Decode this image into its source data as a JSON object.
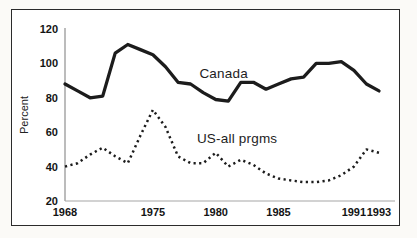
{
  "figure": {
    "kind": "scanned-line-chart"
  },
  "chart_data": {
    "type": "line",
    "title": "",
    "xlabel": "",
    "ylabel": "Percent",
    "xlim": [
      1968,
      1993
    ],
    "ylim": [
      20,
      120
    ],
    "grid": false,
    "legend": "inline-annotations",
    "xticks": [
      1968,
      1975,
      1980,
      1985,
      1991,
      1993
    ],
    "yticks": [
      120,
      100,
      80,
      60,
      40,
      20
    ],
    "x": [
      1968,
      1969,
      1970,
      1971,
      1972,
      1973,
      1974,
      1975,
      1976,
      1977,
      1978,
      1979,
      1980,
      1981,
      1982,
      1983,
      1984,
      1985,
      1986,
      1987,
      1988,
      1989,
      1990,
      1991,
      1992,
      1993
    ],
    "series": [
      {
        "name": "Canada",
        "style": "solid",
        "color": "#1c1c1c",
        "values": [
          88,
          84,
          80,
          81,
          106,
          111,
          108,
          105,
          98,
          89,
          88,
          83,
          79,
          78,
          89,
          89,
          85,
          88,
          91,
          92,
          100,
          100,
          101,
          96,
          88,
          84
        ]
      },
      {
        "name": "US-all prgms",
        "style": "dotted",
        "color": "#1c1c1c",
        "values": [
          40,
          42,
          47,
          51,
          46,
          42,
          58,
          73,
          63,
          46,
          42,
          42,
          48,
          40,
          44,
          41,
          36,
          33,
          32,
          31,
          31,
          32,
          35,
          40,
          50,
          48
        ]
      }
    ],
    "annotations": [
      {
        "text": "Canada",
        "x_year": 1978.7,
        "y_value": 91.5
      },
      {
        "text": "US-all prgms",
        "x_year": 1978.5,
        "y_value": 54.0
      }
    ]
  }
}
